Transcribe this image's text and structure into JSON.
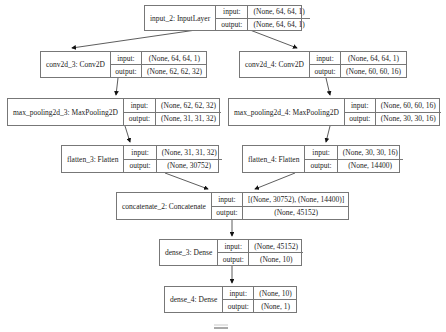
{
  "diagram": {
    "type": "keras-model-plot",
    "labels": {
      "input": "input:",
      "output": "output:"
    },
    "nodes": [
      {
        "id": "input_2",
        "name": "input_2: InputLayer",
        "input": "(None, 64, 64, 1)",
        "output": "(None, 64, 64, 1)"
      },
      {
        "id": "conv2d_3",
        "name": "conv2d_3: Conv2D",
        "input": "(None, 64, 64, 1)",
        "output": "(None, 62, 62, 32)"
      },
      {
        "id": "conv2d_4",
        "name": "conv2d_4: Conv2D",
        "input": "(None, 64, 64, 1)",
        "output": "(None, 60, 60, 16)"
      },
      {
        "id": "max_pooling2d_3",
        "name": "max_pooling2d_3: MaxPooling2D",
        "input": "(None, 62, 62, 32)",
        "output": "(None, 31, 31, 32)"
      },
      {
        "id": "max_pooling2d_4",
        "name": "max_pooling2d_4: MaxPooling2D",
        "input": "(None, 60, 60, 16)",
        "output": "(None, 30, 30, 16)"
      },
      {
        "id": "flatten_3",
        "name": "flatten_3: Flatten",
        "input": "(None, 31, 31, 32)",
        "output": "(None, 30752)"
      },
      {
        "id": "flatten_4",
        "name": "flatten_4: Flatten",
        "input": "(None, 30, 30, 16)",
        "output": "(None, 14400)"
      },
      {
        "id": "concatenate_2",
        "name": "concatenate_2: Concatenate",
        "input": "[(None, 30752), (None, 14400)]",
        "output": "(None, 45152)"
      },
      {
        "id": "dense_3",
        "name": "dense_3: Dense",
        "input": "(None, 45152)",
        "output": "(None, 10)"
      },
      {
        "id": "dense_4",
        "name": "dense_4: Dense",
        "input": "(None, 10)",
        "output": "(None, 1)"
      }
    ],
    "edges": [
      [
        "input_2",
        "conv2d_3"
      ],
      [
        "input_2",
        "conv2d_4"
      ],
      [
        "conv2d_3",
        "max_pooling2d_3"
      ],
      [
        "conv2d_4",
        "max_pooling2d_4"
      ],
      [
        "max_pooling2d_3",
        "flatten_3"
      ],
      [
        "max_pooling2d_4",
        "flatten_4"
      ],
      [
        "flatten_3",
        "concatenate_2"
      ],
      [
        "flatten_4",
        "concatenate_2"
      ],
      [
        "concatenate_2",
        "dense_3"
      ],
      [
        "dense_3",
        "dense_4"
      ]
    ]
  }
}
